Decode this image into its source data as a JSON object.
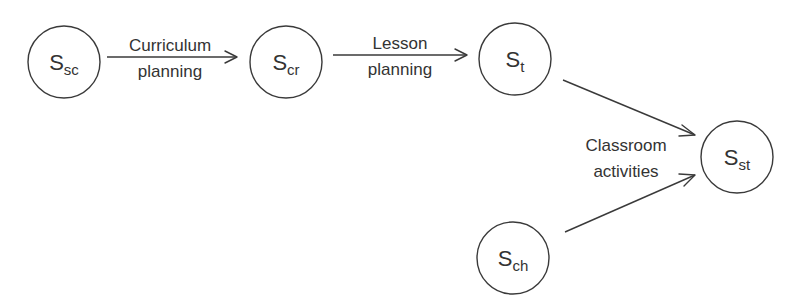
{
  "diagram": {
    "type": "flow",
    "nodes": [
      {
        "id": "Ssc",
        "main": "S",
        "sub": "sc",
        "cx": 64,
        "cy": 62,
        "r": 36
      },
      {
        "id": "Scr",
        "main": "S",
        "sub": "cr",
        "cx": 286,
        "cy": 62,
        "r": 36
      },
      {
        "id": "St",
        "main": "S",
        "sub": "t",
        "cx": 515,
        "cy": 59,
        "r": 36
      },
      {
        "id": "Sst",
        "main": "S",
        "sub": "st",
        "cx": 737,
        "cy": 157,
        "r": 36
      },
      {
        "id": "Sch",
        "main": "S",
        "sub": "ch",
        "cx": 513,
        "cy": 258,
        "r": 36
      }
    ],
    "edges": [
      {
        "from": "Ssc",
        "to": "Scr",
        "label_line1": "Curriculum",
        "label_line2": "planning"
      },
      {
        "from": "Scr",
        "to": "St",
        "label_line1": "Lesson",
        "label_line2": "planning"
      },
      {
        "from": "St",
        "to": "Sst",
        "label_line1": "",
        "label_line2": ""
      },
      {
        "from": "Sch",
        "to": "Sst",
        "label_line1": "",
        "label_line2": ""
      }
    ],
    "shared_label": {
      "line1": "Classroom",
      "line2": "activities",
      "applies_to": [
        "St->Sst",
        "Sch->Sst"
      ]
    },
    "colors": {
      "stroke": "#3a3a3a",
      "text": "#333333",
      "background": "#ffffff"
    }
  }
}
